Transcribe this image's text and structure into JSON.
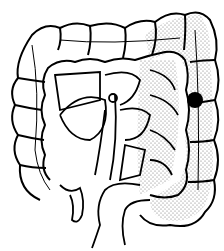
{
  "figure": {
    "marker": {
      "shape": "filled-circle",
      "color": "#000000",
      "cx": 195,
      "cy": 100,
      "r": 8
    },
    "stippled_region": "descending colon / splenic flexure / sigmoid",
    "colors": {
      "line": "#000000",
      "background": "#ffffff",
      "stipple": "#555555"
    }
  }
}
